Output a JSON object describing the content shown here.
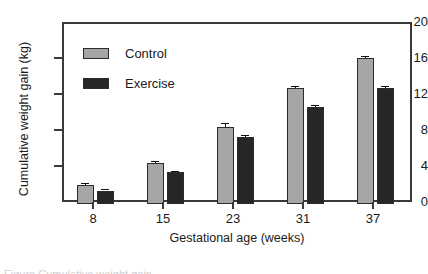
{
  "chart_data": {
    "type": "bar",
    "title": "",
    "xlabel": "Gestational age (weeks)",
    "ylabel": "Cumulative weight gain (kg)",
    "categories": [
      "8",
      "15",
      "23",
      "31",
      "37"
    ],
    "ylim": [
      0,
      20
    ],
    "yticks": [
      0,
      4,
      8,
      12,
      16,
      20
    ],
    "ytick_labels": [
      "0",
      "4",
      "8",
      "12",
      "16",
      "20"
    ],
    "grid": false,
    "legend_position": "top-left",
    "series": [
      {
        "name": "Control",
        "color": "#a6a6a6",
        "values": [
          2.1,
          4.55,
          8.6,
          12.9,
          16.2
        ],
        "errors": [
          0.2,
          0.25,
          0.35,
          0.25,
          0.3
        ]
      },
      {
        "name": "Exercise",
        "color": "#262626",
        "values": [
          1.5,
          3.55,
          7.4,
          10.8,
          12.9
        ],
        "errors": [
          0.2,
          0.15,
          0.25,
          0.2,
          0.2
        ]
      }
    ]
  },
  "caption": {
    "sliver": "Figure   Cumulative weight gain"
  }
}
